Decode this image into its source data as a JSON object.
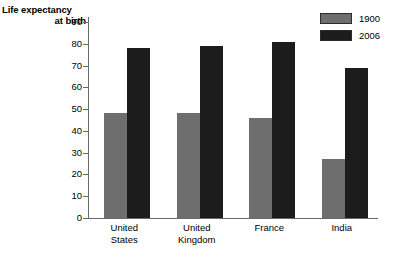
{
  "chart_data": {
    "type": "bar",
    "title": "Life expectancy at birth",
    "title_lines": [
      "Life expectancy",
      "at birth"
    ],
    "xlabel": "",
    "ylabel": "Life expectancy at birth",
    "ylim": [
      0,
      90
    ],
    "y_ticks": [
      0,
      10,
      20,
      30,
      40,
      50,
      60,
      70,
      80,
      90
    ],
    "grid": false,
    "legend_position": "top-right",
    "categories": [
      "United States",
      "United Kingdom",
      "France",
      "India"
    ],
    "category_lines": [
      [
        "United",
        "States"
      ],
      [
        "United",
        "Kingdom"
      ],
      [
        "France",
        ""
      ],
      [
        "India",
        ""
      ]
    ],
    "series": [
      {
        "name": "1900",
        "color": "#6e6e6e",
        "values": [
          48,
          48,
          46,
          27
        ]
      },
      {
        "name": "2006",
        "color": "#1c1c1c",
        "values": [
          78,
          79,
          81,
          69
        ]
      }
    ]
  },
  "legend": {
    "items": [
      {
        "label": "1900",
        "color": "#6e6e6e"
      },
      {
        "label": "2006",
        "color": "#1c1c1c"
      }
    ]
  },
  "axis": {
    "tick_labels": [
      "90",
      "80",
      "70",
      "60",
      "50",
      "40",
      "30",
      "20",
      "10",
      "0"
    ]
  }
}
